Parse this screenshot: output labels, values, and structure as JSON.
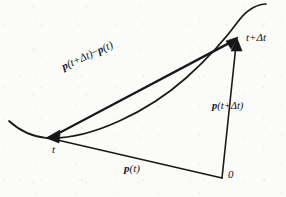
{
  "figure": {
    "kind": "vector-diagram",
    "background_color": "#fbfbf9",
    "ink_color": "#1a1a1a",
    "labels": {
      "difference_vector": {
        "bold_part_1": "p",
        "arg_1": "(t+Δt)",
        "operator": "−",
        "bold_part_2": "p",
        "arg_2": "(t)"
      },
      "position_vector_new": {
        "bold_part": "p",
        "arg": "(t+Δt)"
      },
      "position_vector_old": {
        "bold_part": "p",
        "arg": "(t)"
      },
      "point_t": "t",
      "point_t_plus_dt": "t+Δt",
      "origin": "0"
    },
    "geometry": {
      "origin_point": [
        222,
        178
      ],
      "point_t": [
        47,
        138
      ],
      "point_t_plus_dt": [
        237,
        38
      ],
      "curve_tail_left": [
        9,
        121
      ],
      "curve_tail_right": [
        266,
        4
      ]
    }
  }
}
